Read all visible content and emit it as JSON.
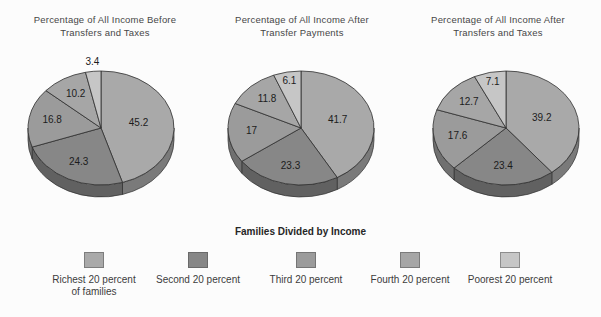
{
  "chart_data": {
    "type": "pie",
    "figure_kind": "three 3d pie charts, slices start at 12 o'clock and proceed clockwise",
    "grid": false,
    "style": {
      "slice_outline": "#2e2e2e",
      "label_color": "#1c1c1c",
      "title_color": "#474747",
      "effect": "3d-extruded",
      "background": "#fcfcfc"
    },
    "legend": {
      "title": "Families Divided by Income",
      "position": "bottom",
      "items": [
        {
          "key": "richest",
          "label_lines": [
            "Richest 20 percent",
            "of families"
          ],
          "color": "#a9a9a9"
        },
        {
          "key": "second",
          "label_lines": [
            "Second 20 percent"
          ],
          "color": "#878787"
        },
        {
          "key": "third",
          "label_lines": [
            "Third 20 percent"
          ],
          "color": "#9b9b9b"
        },
        {
          "key": "fourth",
          "label_lines": [
            "Fourth 20 percent"
          ],
          "color": "#a6a6a6"
        },
        {
          "key": "poorest",
          "label_lines": [
            "Poorest 20 percent"
          ],
          "color": "#c6c6c6"
        }
      ]
    },
    "pies": [
      {
        "title": "Percentage of All Income Before Transfers and Taxes",
        "title_lines": [
          "Percentage of All Income Before",
          "Transfers and Taxes"
        ],
        "slices": [
          {
            "category": "richest",
            "label": "45.2",
            "value": 45.2
          },
          {
            "category": "second",
            "label": "24.3",
            "value": 24.3
          },
          {
            "category": "third",
            "label": "16.8",
            "value": 16.8
          },
          {
            "category": "fourth",
            "label": "10.2",
            "value": 10.2
          },
          {
            "category": "poorest",
            "label": "3.4",
            "value": 3.4
          }
        ]
      },
      {
        "title": "Percentage of All Income After Transfer Payments",
        "title_lines": [
          "Percentage of All Income After",
          "Transfer Payments"
        ],
        "slices": [
          {
            "category": "richest",
            "label": "41.7",
            "value": 41.7
          },
          {
            "category": "second",
            "label": "23.3",
            "value": 23.3
          },
          {
            "category": "third",
            "label": "17",
            "value": 17
          },
          {
            "category": "fourth",
            "label": "11.8",
            "value": 11.8
          },
          {
            "category": "poorest",
            "label": "6.1",
            "value": 6.1
          }
        ]
      },
      {
        "title": "Percentage of All Income After Transfers and Taxes",
        "title_lines": [
          "Percentage of All Income After",
          "Transfers and Taxes"
        ],
        "slices": [
          {
            "category": "richest",
            "label": "39.2",
            "value": 39.2
          },
          {
            "category": "second",
            "label": "23.4",
            "value": 23.4
          },
          {
            "category": "third",
            "label": "17.6",
            "value": 17.6
          },
          {
            "category": "fourth",
            "label": "12.7",
            "value": 12.7
          },
          {
            "category": "poorest",
            "label": "7.1",
            "value": 7.1
          }
        ]
      }
    ]
  }
}
